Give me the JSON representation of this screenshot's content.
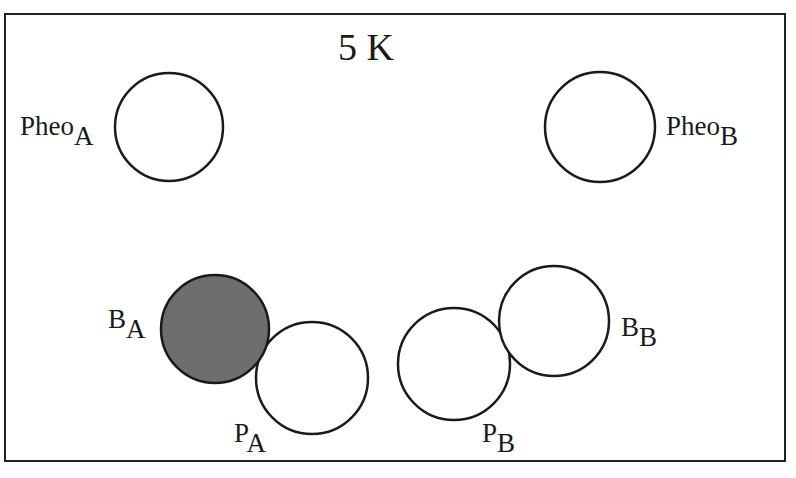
{
  "title": "5 K",
  "colors": {
    "stroke": "#1a1a1a",
    "filled": "#6e6e6e",
    "empty": "#ffffff",
    "frame": "#222222"
  },
  "pigments": [
    {
      "id": "pheo_a",
      "base": "Pheo",
      "sub": "A",
      "filled": false,
      "cx": 169,
      "cy": 127,
      "r": 54
    },
    {
      "id": "pheo_b",
      "base": "Pheo",
      "sub": "B",
      "filled": false,
      "cx": 600,
      "cy": 127,
      "r": 55
    },
    {
      "id": "b_a",
      "base": "B",
      "sub": "A",
      "filled": true,
      "cx": 215,
      "cy": 329,
      "r": 54
    },
    {
      "id": "p_a",
      "base": "P",
      "sub": "A",
      "filled": false,
      "cx": 312,
      "cy": 378,
      "r": 56
    },
    {
      "id": "p_b",
      "base": "P",
      "sub": "B",
      "filled": false,
      "cx": 454,
      "cy": 364,
      "r": 56
    },
    {
      "id": "b_b",
      "base": "B",
      "sub": "B",
      "filled": false,
      "cx": 554,
      "cy": 321,
      "r": 55
    }
  ]
}
